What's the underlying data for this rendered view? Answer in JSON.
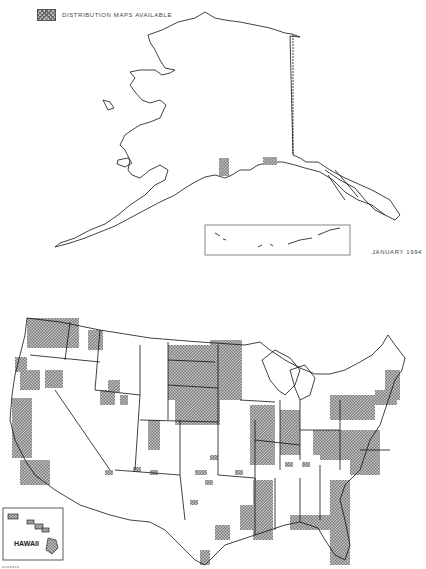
{
  "legend": {
    "label": "DISTRIBUTION MAPS AVAILABLE",
    "pattern": "crosshatch",
    "swatch_color": "#999999"
  },
  "date_label": "JANUARY 1994",
  "insets": {
    "hawaii_label": "HAWAII",
    "aleutian_inset": "Aleutian Islands inset box"
  },
  "footnote": "xxxxxxx",
  "map": {
    "regions": [
      "Alaska",
      "Contiguous United States",
      "Hawaii"
    ],
    "line_color": "#000000",
    "hatch_color": "#888888",
    "highlighted_areas": [
      "Washington (most)",
      "Northern Idaho",
      "Western Montana",
      "North Dakota (east)",
      "Minnesota",
      "Iowa (north)",
      "Illinois",
      "Indiana",
      "Ohio (partial)",
      "Pennsylvania",
      "West Virginia",
      "Virginia",
      "Maryland",
      "New England (partial)",
      "California coast",
      "Louisiana / Mississippi (west)",
      "Florida",
      "South Carolina coast",
      "North Carolina (partial)",
      "Alaska Kenai area",
      "Hawaii"
    ]
  }
}
